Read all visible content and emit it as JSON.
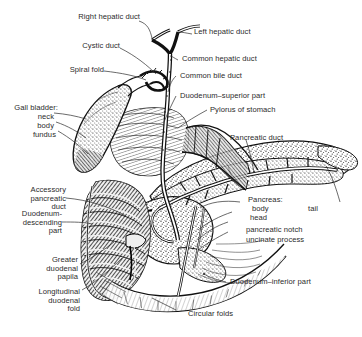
{
  "figure": {
    "style": "engraved line-and-stipple anatomical illustration",
    "ink": "#1a1a1a",
    "text_color": "#2b2b2b",
    "background": "#ffffff"
  },
  "labels": {
    "right_hepatic_duct": "Right hepatic duct",
    "left_hepatic_duct": "Left hepatic duct",
    "cystic_duct": "Cystic duct",
    "common_hepatic_duct": "Common hepatic duct",
    "spiral_fold": "Spiral fold",
    "common_bile_duct": "Common bile duct",
    "duodenum_superior_part": "Duodenum–superior part",
    "gall_bladder": "Gall bladder:",
    "gall_bladder_neck": "neck",
    "gall_bladder_body": "body",
    "gall_bladder_fundus": "fundus",
    "pylorus_of_stomach": "Pylorus of stomach",
    "pancreatic_duct": "Pancreatic duct",
    "accessory_pancreatic_duct": "Accessory\npancreatic\nduct",
    "duodenum_descending_part": "Duodenum-\ndescending\npart",
    "pancreas": "Pancreas:",
    "pancreas_body": "body",
    "pancreas_tail": "tail",
    "pancreas_head": "head",
    "pancreatic_notch": "pancreatic notch",
    "uncinate_process": "uncinate process",
    "greater_duodenal_papila": "Greater\nduodenal\npapila",
    "longitudinal_duodenal_fold": "Longitudinal\nduodenal\nfold",
    "circular_folds": "Circular folds",
    "duodenum_inferior_part": "Duodenum–inferior part"
  }
}
